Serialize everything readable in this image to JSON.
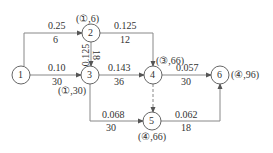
{
  "diagram": {
    "nodes": [
      {
        "id": "1",
        "label": "1",
        "x": 21,
        "y": 75
      },
      {
        "id": "2",
        "label": "2",
        "x": 91,
        "y": 33
      },
      {
        "id": "3",
        "label": "3",
        "x": 90,
        "y": 75
      },
      {
        "id": "4",
        "label": "4",
        "x": 153,
        "y": 75
      },
      {
        "id": "5",
        "label": "5",
        "x": 152,
        "y": 121
      },
      {
        "id": "6",
        "label": "6",
        "x": 220,
        "y": 75
      }
    ],
    "node_annotations": {
      "n2": "(①,6)",
      "n3": "(①,30)",
      "n4": "(③,66)",
      "n5": "(④,66)",
      "n6": "(④,96)"
    },
    "edges": {
      "e12": {
        "from": "1",
        "to": "2",
        "top": "0.25",
        "bottom": "6"
      },
      "e13": {
        "from": "1",
        "to": "3",
        "top": "0.10",
        "bottom": "30"
      },
      "e23": {
        "from": "2",
        "to": "3",
        "top": "0.125",
        "bottom": "18"
      },
      "e24": {
        "from": "2",
        "to": "4",
        "top": "0.125",
        "bottom": "12"
      },
      "e34": {
        "from": "3",
        "to": "4",
        "top": "0.143",
        "bottom": "36"
      },
      "e35": {
        "from": "3",
        "to": "5",
        "top": "0.068",
        "bottom": "30"
      },
      "e45": {
        "from": "4",
        "to": "5",
        "style": "dashed"
      },
      "e46": {
        "from": "4",
        "to": "6",
        "top": "0.057",
        "bottom": "30"
      },
      "e56": {
        "from": "5",
        "to": "6",
        "top": "0.062",
        "bottom": "18"
      }
    },
    "colors": {
      "line": "#888888",
      "text": "#333333",
      "node_stroke": "#555555"
    }
  }
}
